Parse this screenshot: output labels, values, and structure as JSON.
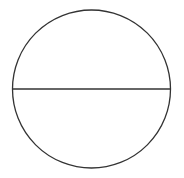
{
  "diagram": {
    "shape": "circle-with-horizontal-diameter",
    "circle": {
      "cx": 91.5,
      "cy": 89,
      "r": 79
    },
    "diameter": {
      "x1": 12.5,
      "y1": 89,
      "x2": 170.5,
      "y2": 89
    },
    "colors": {
      "stroke": "#333333",
      "background": "#ffffff"
    }
  }
}
